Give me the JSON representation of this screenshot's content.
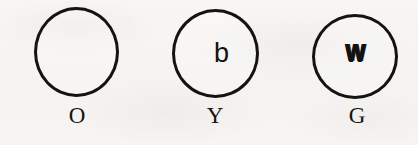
{
  "figure": {
    "background_color": "#f6f5f3",
    "ink_color": "#15120f",
    "items": [
      {
        "id": "circle-o",
        "label": "O",
        "inner_glyph": "",
        "inner_glyph_name": "none",
        "circle": {
          "left": 34,
          "top": 7,
          "width": 85,
          "height": 90,
          "stroke_width": 3
        },
        "label_position": {
          "center_x": 77,
          "top": 104
        }
      },
      {
        "id": "circle-y",
        "label": "Y",
        "inner_glyph": "b",
        "inner_glyph_name": "letter-b",
        "circle": {
          "left": 172,
          "top": 9,
          "width": 87,
          "height": 89,
          "stroke_width": 3
        },
        "label_position": {
          "center_x": 215,
          "top": 104
        }
      },
      {
        "id": "circle-g",
        "label": "G",
        "inner_glyph": "W",
        "inner_glyph_name": "letter-w-overstruck",
        "circle": {
          "left": 312,
          "top": 14,
          "width": 86,
          "height": 85,
          "stroke_width": 3
        },
        "label_position": {
          "center_x": 357,
          "top": 104
        }
      }
    ]
  }
}
